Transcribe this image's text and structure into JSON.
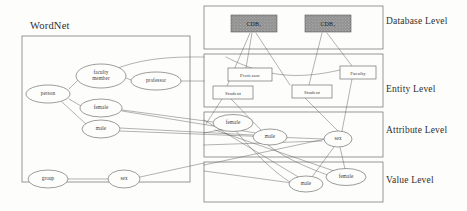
{
  "figure": {
    "panels": [
      {
        "id": "wordnet",
        "title": "WordNet",
        "x": 22,
        "y": 36,
        "w": 168,
        "h": 146
      },
      {
        "id": "database",
        "label": "Database Level",
        "x": 204,
        "y": 6,
        "w": 179,
        "h": 43
      },
      {
        "id": "entity",
        "label": "Entity Level",
        "x": 204,
        "y": 54,
        "w": 179,
        "h": 53
      },
      {
        "id": "attribute",
        "label": "Attribute Level",
        "x": 204,
        "y": 112,
        "w": 179,
        "h": 45
      },
      {
        "id": "value",
        "label": "Value Level",
        "x": 204,
        "y": 162,
        "w": 179,
        "h": 40
      }
    ],
    "level_labels": [
      {
        "text": "Database Level",
        "x": 386,
        "y": 22
      },
      {
        "text": "Entity Level",
        "x": 386,
        "y": 90
      },
      {
        "text": "Attribute Level",
        "x": 386,
        "y": 131
      },
      {
        "text": "Value Level",
        "x": 386,
        "y": 181
      }
    ],
    "wordnet_nodes": [
      {
        "id": "wn-person",
        "label": "person",
        "cx": 48,
        "cy": 94,
        "rx": 22,
        "ry": 9
      },
      {
        "id": "wn-faculty-member",
        "label": "faculty\nmember",
        "cx": 101,
        "cy": 76,
        "rx": 25,
        "ry": 12
      },
      {
        "id": "wn-professor",
        "label": "professor",
        "cx": 156,
        "cy": 81,
        "rx": 25,
        "ry": 9
      },
      {
        "id": "wn-female",
        "label": "female",
        "cx": 101,
        "cy": 108,
        "rx": 21,
        "ry": 9
      },
      {
        "id": "wn-male",
        "label": "male",
        "cx": 101,
        "cy": 129,
        "rx": 19,
        "ry": 9
      },
      {
        "id": "wn-group",
        "label": "group",
        "cx": 48,
        "cy": 179,
        "rx": 20,
        "ry": 9
      },
      {
        "id": "wn-sex",
        "label": "sex",
        "cx": 124,
        "cy": 179,
        "rx": 16,
        "ry": 9
      }
    ],
    "database_nodes": [
      {
        "id": "cdb-1",
        "label": "CDB₁",
        "x": 231,
        "y": 15,
        "w": 46,
        "h": 17
      },
      {
        "id": "cdb-2",
        "label": "CDB₂",
        "x": 305,
        "y": 15,
        "w": 46,
        "h": 17
      }
    ],
    "entity_nodes": [
      {
        "id": "ent-professor",
        "label": "Professor",
        "x": 228,
        "y": 68,
        "w": 44,
        "h": 13
      },
      {
        "id": "ent-faculty",
        "label": "Faculty",
        "x": 340,
        "y": 66,
        "w": 36,
        "h": 13
      },
      {
        "id": "ent-student-1",
        "label": "Student",
        "x": 213,
        "y": 86,
        "w": 40,
        "h": 13
      },
      {
        "id": "ent-student-2",
        "label": "Student",
        "x": 292,
        "y": 85,
        "w": 40,
        "h": 13
      }
    ],
    "attribute_nodes": [
      {
        "id": "attr-female",
        "label": "female",
        "cx": 233,
        "cy": 123,
        "rx": 20,
        "ry": 8.5
      },
      {
        "id": "attr-male",
        "label": "male",
        "cx": 270,
        "cy": 137,
        "rx": 17,
        "ry": 8
      },
      {
        "id": "attr-sex",
        "label": "sex",
        "cx": 338,
        "cy": 139,
        "rx": 14,
        "ry": 8
      }
    ],
    "value_nodes": [
      {
        "id": "val-male",
        "label": "male",
        "cx": 306,
        "cy": 184,
        "rx": 17,
        "ry": 8
      },
      {
        "id": "val-female",
        "label": "female",
        "cx": 346,
        "cy": 177,
        "rx": 20,
        "ry": 8.5
      }
    ],
    "edges": [
      {
        "id": "e-person-faculty",
        "d": "M 69 89 L 78 80"
      },
      {
        "id": "e-person-female",
        "d": "M 69 99 L 81 106"
      },
      {
        "id": "e-person-male",
        "d": "M 62 102 L 87 125"
      },
      {
        "id": "e-faculty-professor",
        "d": "M 126 78 L 131 80"
      },
      {
        "id": "e-group-sex",
        "d": "M 68 179 L 108 179"
      },
      {
        "id": "e-faculty-out-top",
        "d": "M 118 68 C 150 56 185 57 204 57"
      },
      {
        "id": "e-professor-out",
        "d": "M 181 81 L 204 81"
      },
      {
        "id": "e-entity-prof-curve",
        "d": "M 226 57 C 270 80 305 78 340 70"
      },
      {
        "id": "e-cdb1-prof",
        "d": "M 252 33 L 246 68"
      },
      {
        "id": "e-cdb1-stud1",
        "d": "M 250 33 L 227 86"
      },
      {
        "id": "e-cdb1-fac",
        "d": "M 256 33 L 290 85"
      },
      {
        "id": "e-cdb2-stud2",
        "d": "M 322 33 L 309 85"
      },
      {
        "id": "e-cdb2-faculty",
        "d": "M 327 33 L 352 66"
      },
      {
        "id": "e-stud1-down",
        "d": "M 222 99 L 206 124"
      },
      {
        "id": "e-stud1-down2",
        "d": "M 231 99 L 262 131"
      },
      {
        "id": "e-stud2-down",
        "d": "M 305 98 L 338 131"
      },
      {
        "id": "e-fac-down",
        "d": "M 352 79 L 342 131"
      },
      {
        "id": "e-wn-female-attr1",
        "d": "M 122 110 L 213 122"
      },
      {
        "id": "e-wn-female-attr2",
        "d": "M 122 111 L 268 135"
      },
      {
        "id": "e-wn-male-attr1",
        "d": "M 120 128 L 253 135"
      },
      {
        "id": "e-wn-male-attr2",
        "d": "M 120 131 L 324 139"
      },
      {
        "id": "e-wn-sex-in",
        "d": "M 140 177 L 204 163"
      },
      {
        "id": "e-attr-female-val",
        "d": "M 236 131 C 260 160 280 176 290 182"
      },
      {
        "id": "e-attr-male-val",
        "d": "M 268 145 C 290 162 320 172 330 176"
      },
      {
        "id": "e-attr-sex-valmale",
        "d": "M 334 147 L 312 177"
      },
      {
        "id": "e-attr-sex-valfemale",
        "d": "M 340 147 L 345 169"
      },
      {
        "id": "e-cross-1",
        "d": "M 204 133 L 250 124"
      },
      {
        "id": "e-cross-2",
        "d": "M 204 145 L 322 141"
      },
      {
        "id": "e-cross-long1",
        "d": "M 204 171 L 292 183"
      },
      {
        "id": "e-cross-long2",
        "d": "M 204 165 L 330 138"
      },
      {
        "id": "e-cross-long3",
        "d": "M 204 120 L 300 178"
      },
      {
        "id": "e-cross-long4",
        "d": "M 215 130 L 340 173"
      }
    ],
    "colors": {
      "stroke": "#5a5a5a",
      "text": "#333333",
      "panel_border": "#6a6a6a",
      "cdb_fill": "#8d8d8d",
      "background": "#fdfdfc"
    }
  }
}
